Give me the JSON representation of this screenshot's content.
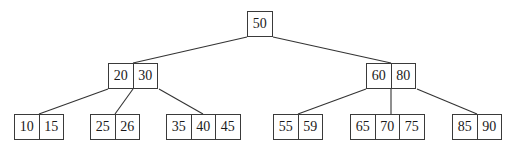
{
  "diagram": {
    "type": "b-tree",
    "nodes": [
      {
        "id": "root",
        "keys": [
          "50"
        ],
        "x": 247,
        "y": 11
      },
      {
        "id": "n-20-30",
        "keys": [
          "20",
          "30"
        ],
        "x": 108,
        "y": 63
      },
      {
        "id": "n-60-80",
        "keys": [
          "60",
          "80"
        ],
        "x": 366,
        "y": 63
      },
      {
        "id": "leaf-10-15",
        "keys": [
          "10",
          "15"
        ],
        "x": 14,
        "y": 114
      },
      {
        "id": "leaf-25-26",
        "keys": [
          "25",
          "26"
        ],
        "x": 90,
        "y": 114
      },
      {
        "id": "leaf-35-40-45",
        "keys": [
          "35",
          "40",
          "45"
        ],
        "x": 166,
        "y": 114
      },
      {
        "id": "leaf-55-59",
        "keys": [
          "55",
          "59"
        ],
        "x": 273,
        "y": 114
      },
      {
        "id": "leaf-65-70-75",
        "keys": [
          "65",
          "70",
          "75"
        ],
        "x": 350,
        "y": 114
      },
      {
        "id": "leaf-85-90",
        "keys": [
          "85",
          "90"
        ],
        "x": 452,
        "y": 114
      }
    ],
    "edges": [
      {
        "from": "root",
        "to": "n-20-30",
        "x1": 247,
        "y1": 37,
        "x2": 133,
        "y2": 63
      },
      {
        "from": "root",
        "to": "n-60-80",
        "x1": 273,
        "y1": 37,
        "x2": 391,
        "y2": 63
      },
      {
        "from": "n-20-30",
        "to": "leaf-10-15",
        "x1": 108,
        "y1": 89,
        "x2": 39,
        "y2": 114
      },
      {
        "from": "n-20-30",
        "to": "leaf-25-26",
        "x1": 133,
        "y1": 89,
        "x2": 115,
        "y2": 114
      },
      {
        "from": "n-20-30",
        "to": "leaf-35-40-45",
        "x1": 159,
        "y1": 89,
        "x2": 203,
        "y2": 114
      },
      {
        "from": "n-60-80",
        "to": "leaf-55-59",
        "x1": 366,
        "y1": 89,
        "x2": 298,
        "y2": 114
      },
      {
        "from": "n-60-80",
        "to": "leaf-65-70-75",
        "x1": 391,
        "y1": 89,
        "x2": 391,
        "y2": 114
      },
      {
        "from": "n-60-80",
        "to": "leaf-85-90",
        "x1": 417,
        "y1": 89,
        "x2": 477,
        "y2": 114
      }
    ]
  }
}
